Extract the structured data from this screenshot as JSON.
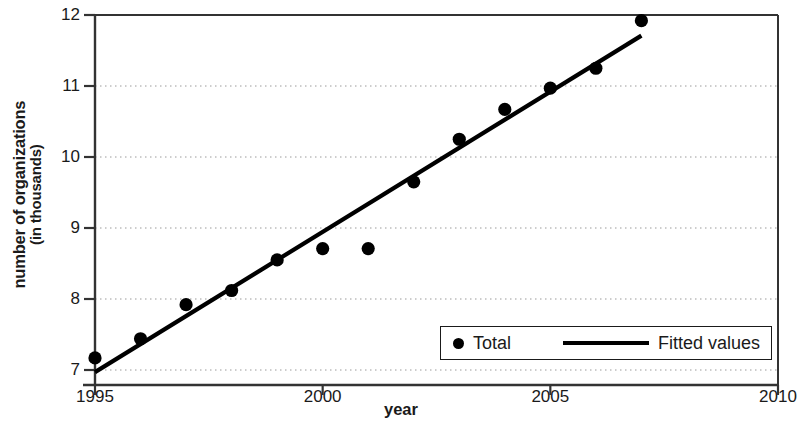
{
  "chart_data": {
    "type": "scatter",
    "title": "",
    "xlabel": "year",
    "ylabel_line1": "number of organizations",
    "ylabel_line2": "(in thousands)",
    "xlim": [
      1995,
      2010
    ],
    "ylim": [
      7,
      12
    ],
    "xticks": [
      1995,
      2000,
      2005,
      2010
    ],
    "xtick_labels": [
      "1995",
      "2000",
      "2005",
      "2010"
    ],
    "yticks": [
      7,
      8,
      9,
      10,
      11,
      12
    ],
    "ytick_labels": [
      "7",
      "8",
      "9",
      "10",
      "11",
      "12"
    ],
    "grid": "horizontal-dotted",
    "legend_position": "bottom-right-inside",
    "series": [
      {
        "name": "Total",
        "type": "scatter",
        "marker": "filled-circle",
        "color": "#000000",
        "x": [
          1995,
          1996,
          1997,
          1998,
          1999,
          2000,
          2001,
          2002,
          2003,
          2004,
          2005,
          2006,
          2007
        ],
        "values": [
          7.17,
          7.44,
          7.92,
          8.12,
          8.55,
          8.71,
          8.71,
          9.65,
          10.25,
          10.67,
          10.97,
          11.25,
          11.92
        ]
      },
      {
        "name": "Fitted values",
        "type": "line",
        "color": "#000000",
        "x": [
          1995,
          2007
        ],
        "values": [
          6.97,
          11.71
        ]
      }
    ]
  },
  "legend": {
    "entries": [
      {
        "label": "Total",
        "marker": "dot"
      },
      {
        "label": "Fitted values",
        "marker": "line"
      }
    ]
  }
}
